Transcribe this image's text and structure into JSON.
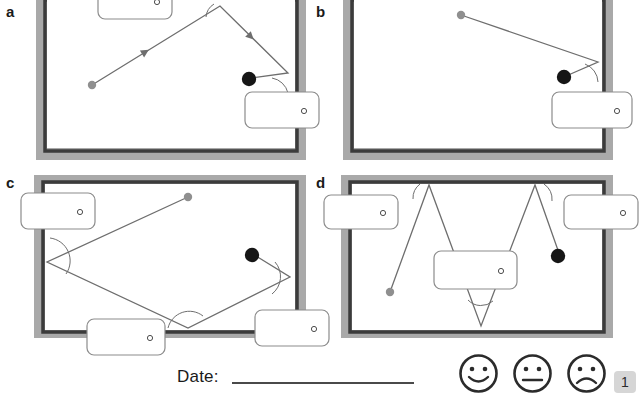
{
  "worksheet": {
    "panels": [
      {
        "id": "a",
        "label": "a",
        "answer_boxes": [
          {
            "name": "answer-box-a1",
            "value": "",
            "unit_symbol": "°"
          },
          {
            "name": "answer-box-a2",
            "value": "",
            "unit_symbol": "°"
          }
        ]
      },
      {
        "id": "b",
        "label": "b",
        "answer_boxes": [
          {
            "name": "answer-box-b1",
            "value": "",
            "unit_symbol": "°"
          }
        ]
      },
      {
        "id": "c",
        "label": "c",
        "answer_boxes": [
          {
            "name": "answer-box-c1",
            "value": "",
            "unit_symbol": "°"
          },
          {
            "name": "answer-box-c2",
            "value": "",
            "unit_symbol": "°"
          },
          {
            "name": "answer-box-c3",
            "value": "",
            "unit_symbol": "°"
          }
        ]
      },
      {
        "id": "d",
        "label": "d",
        "answer_boxes": [
          {
            "name": "answer-box-d1",
            "value": "",
            "unit_symbol": "°"
          },
          {
            "name": "answer-box-d2",
            "value": "",
            "unit_symbol": "°"
          },
          {
            "name": "answer-box-d3",
            "value": "",
            "unit_symbol": "°"
          }
        ]
      }
    ]
  },
  "footer": {
    "date_label": "Date:",
    "date_value": "",
    "faces": [
      {
        "name": "smiley-happy-icon",
        "mood": "happy"
      },
      {
        "name": "smiley-neutral-icon",
        "mood": "neutral"
      },
      {
        "name": "smiley-sad-icon",
        "mood": "sad"
      }
    ],
    "page_number": "1"
  },
  "colors": {
    "cushion_outer": "#a9a9a9",
    "cushion_rail": "#3b3b3b",
    "table_felt": "#ffffff",
    "cue_ball": "#8f8f8f",
    "target_ball": "#161616",
    "path_line": "#6e6e6e",
    "box_border": "#8c8c8c",
    "text": "#1a1a1a",
    "page_badge": "#d6d6d6"
  }
}
